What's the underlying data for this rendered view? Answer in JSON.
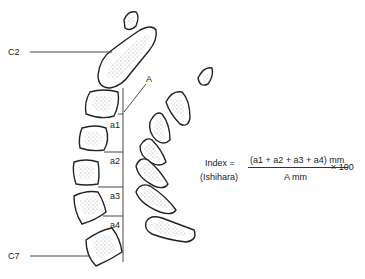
{
  "figure": {
    "labels": {
      "c2": "C2",
      "c7": "C7",
      "a": "A",
      "a1": "a1",
      "a2": "a2",
      "a3": "a3",
      "a4": "a4"
    },
    "formula": {
      "name": "Index =",
      "source": "(Ishihara)",
      "numerator": "(a1 + a2 + a3 + a4) mm",
      "denominator": "A mm",
      "multiplier": "× 100"
    },
    "colors": {
      "outline": "#222222",
      "stipple": "#999999",
      "background": "#ffffff"
    }
  }
}
